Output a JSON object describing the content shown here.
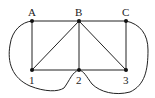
{
  "diagram": {
    "type": "graph",
    "nodes": [
      {
        "id": "A",
        "label": "A",
        "x": 32,
        "y": 21
      },
      {
        "id": "B",
        "label": "B",
        "x": 79,
        "y": 21
      },
      {
        "id": "C",
        "label": "C",
        "x": 126,
        "y": 21
      },
      {
        "id": "1",
        "label": "1",
        "x": 32,
        "y": 70
      },
      {
        "id": "2",
        "label": "2",
        "x": 79,
        "y": 70
      },
      {
        "id": "3",
        "label": "3",
        "x": 126,
        "y": 70
      }
    ],
    "edges": [
      [
        "A",
        "B"
      ],
      [
        "B",
        "C"
      ],
      [
        "A",
        "1"
      ],
      [
        "B",
        "1"
      ],
      [
        "B",
        "2"
      ],
      [
        "B",
        "3"
      ],
      [
        "C",
        "3"
      ],
      [
        "1",
        "2"
      ],
      [
        "2",
        "3"
      ],
      [
        "A",
        "2",
        "curved-left"
      ],
      [
        "C",
        "2",
        "curved-right"
      ]
    ]
  }
}
